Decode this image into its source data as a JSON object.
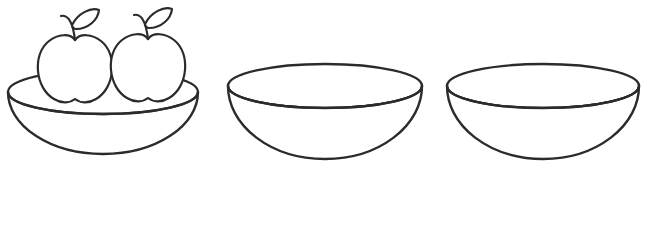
{
  "canvas": {
    "width": 649,
    "height": 238,
    "background_color": "#ffffff",
    "stroke_color": "#2b2b2b",
    "style": "black-and-white line drawing / coloring-book outline",
    "title": "Three bowls, the first one holding two apples"
  },
  "scene": {
    "object_count": 3,
    "objects": [
      {
        "name": "bowl-with-apples",
        "label": "Bowl with two apples",
        "index": 1,
        "filled": true,
        "contents": "2 apples",
        "rim": {
          "cx": 103,
          "cy": 92,
          "rx": 95,
          "ry": 22
        },
        "body_bottom_y": 154
      },
      {
        "name": "empty-bowl-middle",
        "label": "Empty bowl",
        "index": 2,
        "filled": false,
        "contents": "empty",
        "rim": {
          "cx": 325,
          "cy": 86,
          "rx": 97,
          "ry": 22
        },
        "body_bottom_y": 159
      },
      {
        "name": "empty-bowl-right",
        "label": "Empty bowl",
        "index": 3,
        "filled": false,
        "contents": "empty",
        "rim": {
          "cx": 543,
          "cy": 86,
          "rx": 96,
          "ry": 22
        },
        "body_bottom_y": 159
      }
    ],
    "apples": [
      {
        "name": "apple-left",
        "label": "Apple",
        "cx": 75,
        "cy": 65,
        "rx": 37,
        "stem_direction": "up-left",
        "leaf_direction": "up-right"
      },
      {
        "name": "apple-right",
        "label": "Apple",
        "cx": 148,
        "cy": 64,
        "rx": 37,
        "stem_direction": "up-left",
        "leaf_direction": "up-right"
      }
    ]
  },
  "caption": {
    "alt_text": "Line drawing of three bowls; the left bowl contains two apples with stems and leaves, the middle and right bowls are empty."
  }
}
